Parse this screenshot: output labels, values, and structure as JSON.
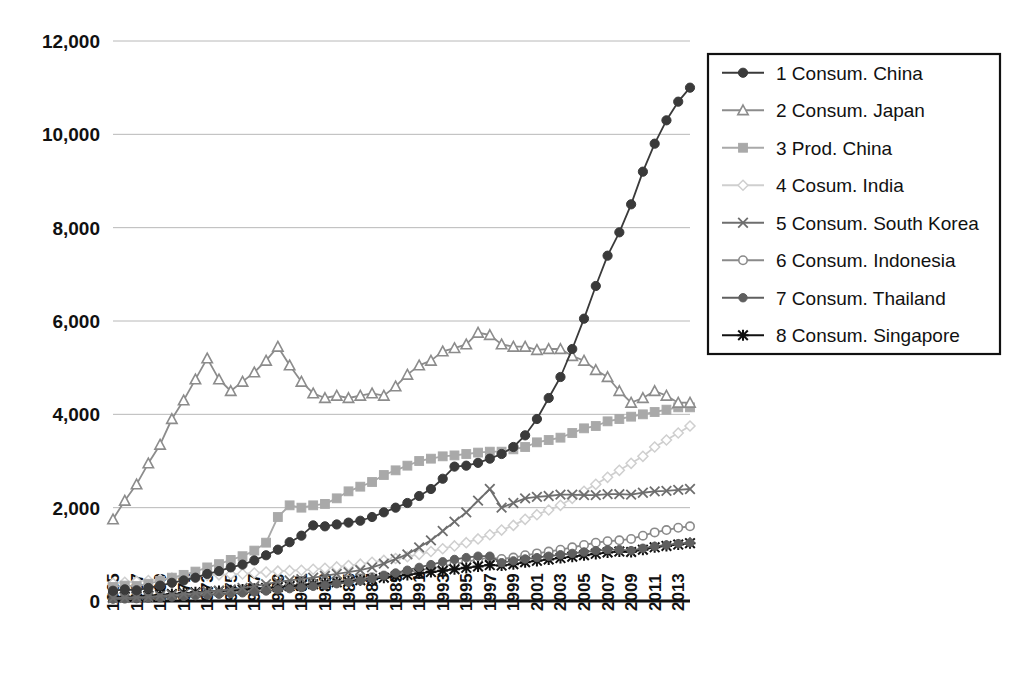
{
  "chart_data": {
    "type": "line",
    "title": "",
    "subtitle": "",
    "xlabel": "",
    "ylabel": "",
    "xlim": [
      1965,
      2014
    ],
    "ylim": [
      0,
      12000
    ],
    "ytick_values": [
      0,
      2000,
      4000,
      6000,
      8000,
      10000,
      12000
    ],
    "ytick_labels": [
      "0",
      "2,000",
      "4,000",
      "6,000",
      "8,000",
      "10,000",
      "12,000"
    ],
    "xtick_labels": [
      "1965",
      "1967",
      "1969",
      "1971",
      "1973",
      "1975",
      "1977",
      "1979",
      "1981",
      "1983",
      "1985",
      "1987",
      "1989",
      "1991",
      "1993",
      "1995",
      "1997",
      "1999",
      "2001",
      "2003",
      "2005",
      "2007",
      "2009",
      "2011",
      "2013"
    ],
    "x": [
      1965,
      1966,
      1967,
      1968,
      1969,
      1970,
      1971,
      1972,
      1973,
      1974,
      1975,
      1976,
      1977,
      1978,
      1979,
      1980,
      1981,
      1982,
      1983,
      1984,
      1985,
      1986,
      1987,
      1988,
      1989,
      1990,
      1991,
      1992,
      1993,
      1994,
      1995,
      1996,
      1997,
      1998,
      1999,
      2000,
      2001,
      2002,
      2003,
      2004,
      2005,
      2006,
      2007,
      2008,
      2009,
      2010,
      2011,
      2012,
      2013,
      2014
    ],
    "grid": true,
    "legend_position": "right-top",
    "series": [
      {
        "name": "1 Consum. China",
        "legend_label": "1 Consum. China",
        "marker": "filled-circle",
        "color": "#3a3a3a",
        "values": [
          220,
          250,
          230,
          280,
          330,
          390,
          440,
          500,
          580,
          640,
          720,
          780,
          870,
          980,
          1100,
          1260,
          1400,
          1620,
          1600,
          1640,
          1680,
          1720,
          1800,
          1900,
          2000,
          2100,
          2250,
          2400,
          2620,
          2880,
          2900,
          2960,
          3050,
          3150,
          3300,
          3550,
          3900,
          4350,
          4800,
          5400,
          6050,
          6750,
          7400,
          7900,
          8500,
          9200,
          9800,
          10300,
          10700,
          11000
        ]
      },
      {
        "name": "2 Consum. Japan",
        "legend_label": "2 Consum. Japan",
        "marker": "open-triangle",
        "color": "#8c8c8c",
        "values": [
          1750,
          2150,
          2500,
          2950,
          3350,
          3900,
          4300,
          4750,
          5200,
          4750,
          4500,
          4700,
          4900,
          5150,
          5450,
          5050,
          4700,
          4450,
          4350,
          4400,
          4350,
          4400,
          4450,
          4400,
          4600,
          4850,
          5050,
          5150,
          5350,
          5420,
          5500,
          5750,
          5700,
          5500,
          5450,
          5450,
          5380,
          5400,
          5400,
          5250,
          5150,
          4950,
          4800,
          4500,
          4250,
          4350,
          4500,
          4400,
          4250,
          4250
        ]
      },
      {
        "name": "3 Prod. China",
        "legend_label": "3 Prod. China",
        "marker": "filled-square",
        "color": "#a9a9a9",
        "values": [
          300,
          330,
          320,
          370,
          430,
          500,
          560,
          630,
          720,
          790,
          880,
          960,
          1080,
          1250,
          1800,
          2050,
          2000,
          2050,
          2080,
          2200,
          2350,
          2450,
          2550,
          2700,
          2800,
          2900,
          3000,
          3050,
          3100,
          3120,
          3150,
          3180,
          3200,
          3200,
          3250,
          3300,
          3400,
          3450,
          3500,
          3600,
          3700,
          3750,
          3850,
          3900,
          3950,
          4000,
          4050,
          4100,
          4150,
          4150
        ]
      },
      {
        "name": "4 Cosum. India",
        "legend_label": "4 Cosum. India",
        "marker": "open-diamond",
        "color": "#cfcfcf",
        "values": [
          380,
          400,
          420,
          440,
          460,
          490,
          510,
          530,
          550,
          560,
          570,
          580,
          600,
          620,
          640,
          650,
          660,
          680,
          700,
          730,
          760,
          790,
          830,
          870,
          910,
          950,
          1000,
          1060,
          1120,
          1180,
          1250,
          1330,
          1420,
          1520,
          1620,
          1750,
          1850,
          1950,
          2050,
          2200,
          2350,
          2500,
          2650,
          2800,
          2950,
          3100,
          3300,
          3450,
          3600,
          3750
        ]
      },
      {
        "name": "5 Consum. South Korea",
        "legend_label": "5 Consum. South Korea",
        "marker": "x-cross",
        "color": "#6e6e6e",
        "values": [
          60,
          70,
          80,
          90,
          110,
          130,
          150,
          170,
          200,
          220,
          250,
          280,
          320,
          360,
          410,
          440,
          470,
          500,
          540,
          580,
          620,
          660,
          720,
          800,
          900,
          1000,
          1150,
          1300,
          1500,
          1700,
          1900,
          2150,
          2400,
          2000,
          2100,
          2200,
          2230,
          2250,
          2280,
          2280,
          2270,
          2270,
          2290,
          2290,
          2280,
          2320,
          2350,
          2360,
          2380,
          2400
        ]
      },
      {
        "name": "6 Consum. Indonesia",
        "legend_label": "6 Consum. Indonesia",
        "marker": "open-circle",
        "color": "#8a8a8a",
        "values": [
          70,
          75,
          80,
          90,
          100,
          115,
          130,
          145,
          165,
          180,
          200,
          220,
          240,
          265,
          290,
          320,
          350,
          380,
          400,
          420,
          450,
          480,
          510,
          545,
          580,
          620,
          660,
          700,
          740,
          790,
          840,
          890,
          930,
          900,
          930,
          980,
          1020,
          1060,
          1100,
          1150,
          1200,
          1250,
          1280,
          1300,
          1330,
          1400,
          1470,
          1520,
          1570,
          1600
        ]
      },
      {
        "name": "7 Consum. Thailand",
        "legend_label": "7 Consum. Thailand",
        "marker": "filled-circle-mid",
        "color": "#5f5f5f",
        "values": [
          40,
          45,
          50,
          60,
          70,
          85,
          100,
          115,
          130,
          145,
          160,
          175,
          195,
          215,
          240,
          265,
          290,
          315,
          340,
          370,
          400,
          435,
          480,
          540,
          600,
          660,
          720,
          780,
          840,
          890,
          930,
          960,
          960,
          820,
          860,
          900,
          930,
          960,
          990,
          1020,
          1050,
          1080,
          1100,
          1100,
          1080,
          1130,
          1170,
          1200,
          1230,
          1250
        ]
      },
      {
        "name": "8 Consum. Singapore",
        "legend_label": "8 Consum. Singapore",
        "marker": "filled-star",
        "color": "#111111",
        "values": [
          80,
          90,
          100,
          115,
          130,
          150,
          170,
          185,
          200,
          215,
          230,
          245,
          260,
          280,
          300,
          320,
          340,
          360,
          380,
          400,
          420,
          445,
          470,
          500,
          530,
          560,
          590,
          620,
          650,
          680,
          710,
          740,
          770,
          760,
          790,
          830,
          860,
          890,
          920,
          950,
          980,
          1010,
          1040,
          1060,
          1050,
          1100,
          1150,
          1180,
          1210,
          1240
        ]
      }
    ]
  },
  "legend": {
    "items": [
      {
        "label": "1 Consum. China"
      },
      {
        "label": "2 Consum. Japan"
      },
      {
        "label": "3 Prod. China"
      },
      {
        "label": "4 Cosum. India"
      },
      {
        "label": "5 Consum. South Korea"
      },
      {
        "label": "6 Consum. Indonesia"
      },
      {
        "label": "7 Consum. Thailand"
      },
      {
        "label": "8 Consum. Singapore"
      }
    ]
  }
}
